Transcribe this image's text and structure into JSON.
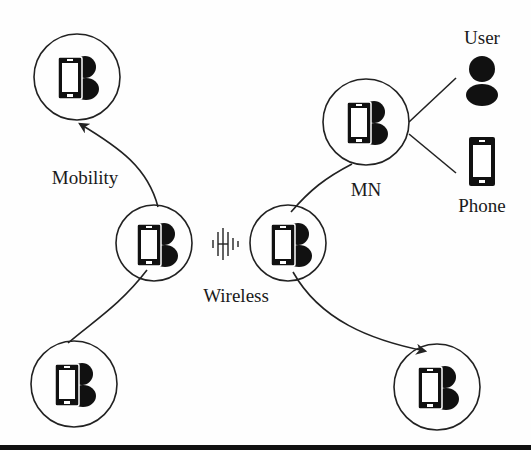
{
  "diagram": {
    "labels": {
      "user": "User",
      "phone": "Phone",
      "mn": "MN",
      "mobility": "Mobility",
      "wireless": "Wireless"
    },
    "nodes": [
      {
        "id": "top-left",
        "cx": 77,
        "cy": 77,
        "r": 43
      },
      {
        "id": "mn",
        "cx": 366,
        "cy": 122,
        "r": 43
      },
      {
        "id": "center-left",
        "cx": 154,
        "cy": 243,
        "r": 38
      },
      {
        "id": "center-right",
        "cx": 288,
        "cy": 243,
        "r": 38
      },
      {
        "id": "bottom-left",
        "cx": 74,
        "cy": 384,
        "r": 43
      },
      {
        "id": "bottom-right",
        "cx": 437,
        "cy": 387,
        "r": 43
      }
    ],
    "edges": [
      {
        "from": "center-left",
        "to": "top-left",
        "type": "arrow",
        "label": "Mobility"
      },
      {
        "from": "center-left",
        "to": "bottom-left",
        "type": "line"
      },
      {
        "from": "center-right",
        "to": "mn",
        "type": "line"
      },
      {
        "from": "center-right",
        "to": "bottom-right",
        "type": "arrow"
      },
      {
        "from": "mn",
        "to": "user",
        "type": "line"
      },
      {
        "from": "mn",
        "to": "phone",
        "type": "line"
      },
      {
        "from": "center-left",
        "to": "center-right",
        "type": "wireless",
        "label": "Wireless"
      }
    ],
    "colors": {
      "stroke": "#222222",
      "fill": "#111111",
      "background": "#fefefe"
    }
  }
}
